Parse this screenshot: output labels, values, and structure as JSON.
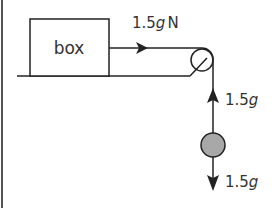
{
  "diagram": {
    "box_label": "box",
    "tension_on_box": {
      "value": "1.5",
      "unit_g": "g",
      "unit": "N"
    },
    "tension_up": {
      "value": "1.5",
      "unit_g": "g"
    },
    "weight_down": {
      "value": "1.5",
      "unit_g": "g"
    },
    "colors": {
      "stroke": "#222222",
      "ball_fill": "#a8a8a8",
      "background": "#ffffff"
    }
  }
}
